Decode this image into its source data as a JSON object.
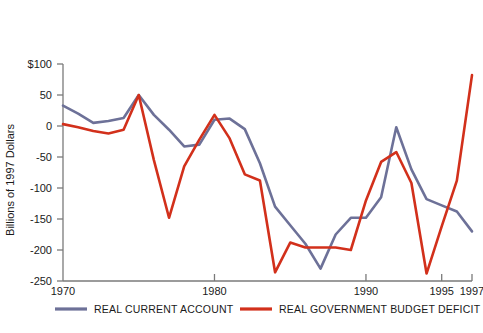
{
  "chart_data": {
    "type": "line",
    "title": "",
    "xlabel": "",
    "ylabel": "Billions of 1997 Dollars",
    "xlim": [
      1970,
      1997
    ],
    "ylim": [
      -250,
      100
    ],
    "grid": false,
    "legend_position": "bottom",
    "y_ticks": [
      100,
      50,
      0,
      -50,
      -100,
      -150,
      -200,
      -250
    ],
    "y_tick_labels": [
      "$100",
      "50",
      "0",
      "-50",
      "-100",
      "-150",
      "-200",
      "-250"
    ],
    "x_ticks": [
      1970,
      1980,
      1990,
      1995,
      1997
    ],
    "x_tick_labels": [
      "1970",
      "1980",
      "1990",
      "1995",
      "1997"
    ],
    "x": [
      1970,
      1971,
      1972,
      1973,
      1974,
      1975,
      1976,
      1977,
      1978,
      1979,
      1980,
      1981,
      1982,
      1983,
      1984,
      1985,
      1986,
      1987,
      1988,
      1989,
      1990,
      1991,
      1992,
      1993,
      1994,
      1995,
      1996,
      1997
    ],
    "series": [
      {
        "name": "REAL CURRENT ACCOUNT",
        "color": "#6d7198",
        "values": [
          33,
          20,
          5,
          8,
          13,
          50,
          18,
          -6,
          -33,
          -30,
          10,
          12,
          -5,
          -60,
          -130,
          -160,
          -190,
          -230,
          -175,
          -148,
          -148,
          -115,
          -2,
          -70,
          -118,
          -128,
          -138,
          -170
        ]
      },
      {
        "name": "REAL GOVERNMENT BUDGET DEFICIT",
        "color": "#d2301b",
        "values": [
          3,
          -2,
          -8,
          -12,
          -6,
          50,
          -55,
          -148,
          -65,
          -22,
          18,
          -20,
          -78,
          -88,
          -236,
          -188,
          -196,
          -196,
          -196,
          -200,
          -120,
          -58,
          -42,
          -92,
          -238,
          -162,
          -88,
          82
        ]
      }
    ]
  },
  "legend": {
    "items": [
      {
        "label": "REAL CURRENT ACCOUNT",
        "color": "#6d7198"
      },
      {
        "label": "REAL GOVERNMENT BUDGET DEFICIT",
        "color": "#d2301b"
      }
    ]
  }
}
